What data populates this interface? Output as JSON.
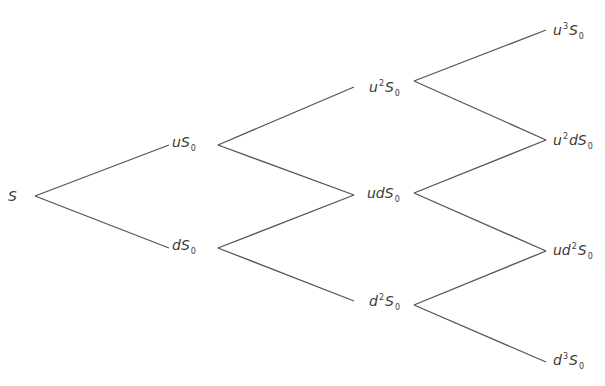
{
  "diagram": {
    "title": "",
    "type": "binomial-tree",
    "line_color": "#555555",
    "text_color": "#3a3a3a",
    "nodes": [
      {
        "id": "n0",
        "step": 0,
        "label": "S",
        "base": "S",
        "sup": "",
        "mid": "",
        "sym": "",
        "sub": "",
        "x": 8,
        "y": 196,
        "anchor_left": 38,
        "anchor_right": 38
      },
      {
        "id": "n1u",
        "step": 1,
        "label": "uS0",
        "base": "u",
        "sup": "",
        "mid": "",
        "sym": "S",
        "sub": "0",
        "x": 172,
        "y": 145,
        "anchor_left": 170,
        "anchor_right": 218
      },
      {
        "id": "n1d",
        "step": 1,
        "label": "dS0",
        "base": "d",
        "sup": "",
        "mid": "",
        "sym": "S",
        "sub": "0",
        "x": 172,
        "y": 248,
        "anchor_left": 170,
        "anchor_right": 218
      },
      {
        "id": "n2uu",
        "step": 2,
        "label": "u2S0",
        "base": "u",
        "sup": "2",
        "mid": "",
        "sym": "S",
        "sub": "0",
        "x": 369,
        "y": 89,
        "anchor_left": 354,
        "anchor_right": 414
      },
      {
        "id": "n2ud",
        "step": 2,
        "label": "udS0",
        "base": "ud",
        "sup": "",
        "mid": "",
        "sym": "S",
        "sub": "0",
        "x": 367,
        "y": 196,
        "anchor_left": 354,
        "anchor_right": 414
      },
      {
        "id": "n2dd",
        "step": 2,
        "label": "d2S0",
        "base": "d",
        "sup": "2",
        "mid": "",
        "sym": "S",
        "sub": "0",
        "x": 369,
        "y": 303,
        "anchor_left": 354,
        "anchor_right": 414
      },
      {
        "id": "n3uuu",
        "step": 3,
        "label": "u3S0",
        "base": "u",
        "sup": "3",
        "mid": "",
        "sym": "S",
        "sub": "0",
        "x": 553,
        "y": 32,
        "anchor_left": 546,
        "anchor_right": 546
      },
      {
        "id": "n3uud",
        "step": 3,
        "label": "u2dS0",
        "base": "u",
        "sup": "2",
        "mid": "d",
        "sym": "S",
        "sub": "0",
        "x": 553,
        "y": 142,
        "anchor_left": 546,
        "anchor_right": 546
      },
      {
        "id": "n3udd",
        "step": 3,
        "label": "ud2S0",
        "base": "ud",
        "sup": "2",
        "mid": "",
        "sym": "S",
        "sub": "0",
        "x": 553,
        "y": 252,
        "anchor_left": 546,
        "anchor_right": 546
      },
      {
        "id": "n3ddd",
        "step": 3,
        "label": "d3S0",
        "base": "d",
        "sup": "3",
        "mid": "",
        "sym": "S",
        "sub": "0",
        "x": 553,
        "y": 362,
        "anchor_left": 546,
        "anchor_right": 546
      }
    ],
    "edges": [
      {
        "from": "n0",
        "to": "n1u",
        "x1": 35,
        "y1": 196,
        "x2": 169,
        "y2": 145
      },
      {
        "from": "n0",
        "to": "n1d",
        "x1": 35,
        "y1": 196,
        "x2": 169,
        "y2": 248
      },
      {
        "from": "n1u",
        "to": "n2uu",
        "x1": 218,
        "y1": 145,
        "x2": 354,
        "y2": 87
      },
      {
        "from": "n1u",
        "to": "n2ud",
        "x1": 218,
        "y1": 145,
        "x2": 354,
        "y2": 195
      },
      {
        "from": "n1d",
        "to": "n2ud",
        "x1": 218,
        "y1": 248,
        "x2": 354,
        "y2": 195
      },
      {
        "from": "n1d",
        "to": "n2dd",
        "x1": 218,
        "y1": 248,
        "x2": 354,
        "y2": 301
      },
      {
        "from": "n2uu",
        "to": "n3uuu",
        "x1": 414,
        "y1": 81,
        "x2": 546,
        "y2": 30
      },
      {
        "from": "n2uu",
        "to": "n3uud",
        "x1": 414,
        "y1": 81,
        "x2": 546,
        "y2": 140
      },
      {
        "from": "n2ud",
        "to": "n3uud",
        "x1": 414,
        "y1": 193,
        "x2": 546,
        "y2": 140
      },
      {
        "from": "n2ud",
        "to": "n3udd",
        "x1": 414,
        "y1": 193,
        "x2": 546,
        "y2": 251
      },
      {
        "from": "n2dd",
        "to": "n3udd",
        "x1": 414,
        "y1": 305,
        "x2": 546,
        "y2": 251
      },
      {
        "from": "n2dd",
        "to": "n3ddd",
        "x1": 414,
        "y1": 305,
        "x2": 546,
        "y2": 362
      }
    ]
  }
}
